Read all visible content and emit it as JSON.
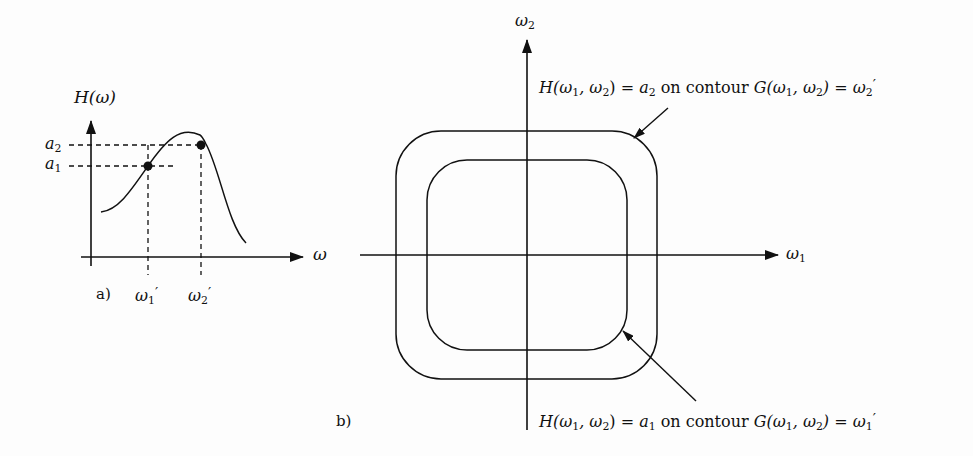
{
  "panel_a": {
    "label": "a)",
    "y_axis_label": "H(ω)",
    "x_axis_label": "ω",
    "levels": [
      {
        "name": "a",
        "sub": "2"
      },
      {
        "name": "a",
        "sub": "1"
      }
    ],
    "frequencies": [
      {
        "name": "ω",
        "sub": "1",
        "prime": "′"
      },
      {
        "name": "ω",
        "sub": "2",
        "prime": "′"
      }
    ]
  },
  "panel_b": {
    "label": "b)",
    "y_axis": {
      "name": "ω",
      "sub": "2"
    },
    "x_axis": {
      "name": "ω",
      "sub": "1"
    },
    "outer_annotation": {
      "lhs": "H(ω",
      "sub1": "1",
      "mid": ", ω",
      "sub2": "2",
      "close": ") = ",
      "value": "a",
      "value_sub": "2",
      "text": " on contour ",
      "g": "G(ω",
      "gsub1": "1",
      "gmid": ", ω",
      "gsub2": "2",
      "gclose": ") = ω",
      "rhs_sub": "2",
      "prime": "′"
    },
    "inner_annotation": {
      "lhs": "H(ω",
      "sub1": "1",
      "mid": ", ω",
      "sub2": "2",
      "close": ") = ",
      "value": "a",
      "value_sub": "1",
      "text": " on contour ",
      "g": "G(ω",
      "gsub1": "1",
      "gmid": ", ω",
      "gsub2": "2",
      "gclose": ") = ω",
      "rhs_sub": "1",
      "prime": "′"
    }
  }
}
